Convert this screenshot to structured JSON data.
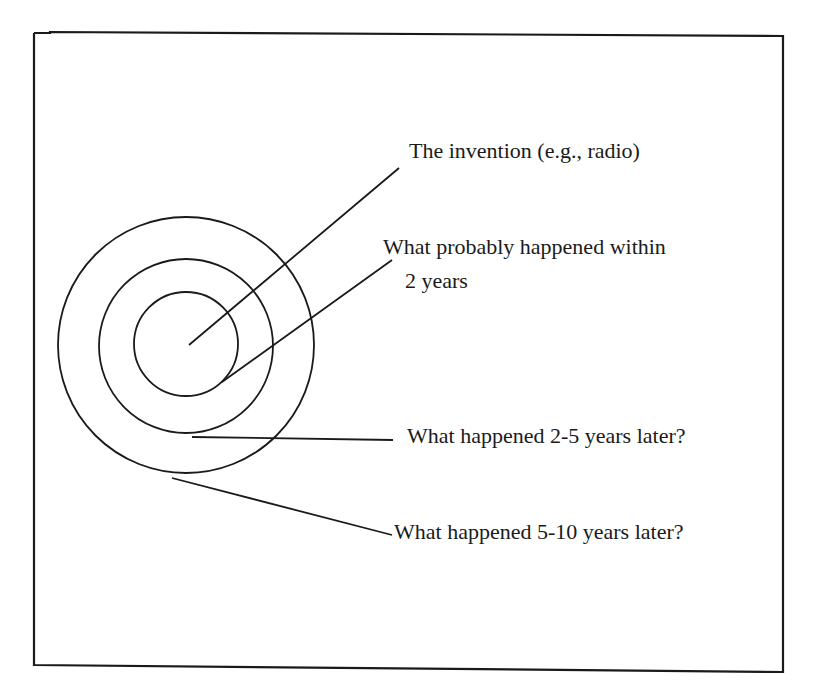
{
  "figure": {
    "type": "concentric-circles-diagram",
    "ink_color": "#1a1a1a",
    "background_color": "#ffffff",
    "rings": [
      {
        "name": "invention",
        "level": 0
      },
      {
        "name": "within-2-years",
        "level": 1
      },
      {
        "name": "2-5-years",
        "level": 2
      },
      {
        "name": "5-10-years",
        "level": 3
      }
    ]
  },
  "labels": {
    "invention": "The invention (e.g., radio)",
    "within_2_years_line1": "What probably happened within",
    "within_2_years_line2": "2 years",
    "years_2_5": "What happened 2-5 years later?",
    "years_5_10": "What happened 5-10 years later?"
  }
}
